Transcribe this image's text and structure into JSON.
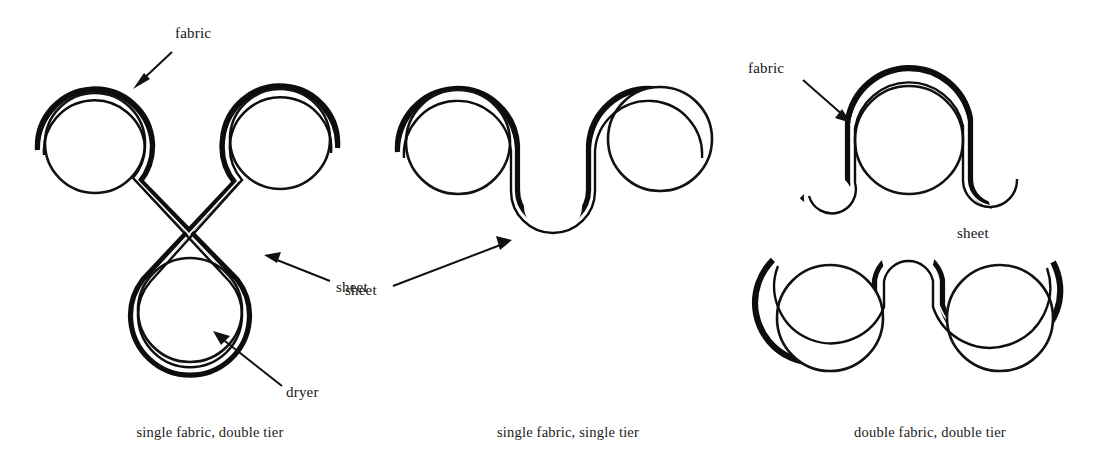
{
  "figure": {
    "background_color": "#ffffff",
    "ink_color": "#0d0d0d",
    "width": 1103,
    "height": 467
  },
  "panels": [
    {
      "id": "single-fabric-double-tier",
      "caption": "single fabric, double tier",
      "caption_x": 210,
      "caption_y": 437,
      "annotations": [
        {
          "name": "fabric",
          "label": "fabric",
          "text_x": 175,
          "text_y": 38,
          "leader_from_x": 172,
          "leader_from_y": 52,
          "leader_to_x": 133,
          "leader_to_y": 89,
          "arrow_angle_deg": 136
        },
        {
          "name": "sheet",
          "label": "sheet",
          "text_x": 336,
          "text_y": 292,
          "leader_from_x": 330,
          "leader_from_y": 281,
          "leader_to_x": 264,
          "leader_to_y": 255,
          "arrow_angle_deg": 201
        },
        {
          "name": "dryer",
          "label": "dryer",
          "text_x": 286,
          "text_y": 397,
          "leader_from_x": 282,
          "leader_from_y": 386,
          "leader_to_x": 213,
          "leader_to_y": 331,
          "arrow_angle_deg": 218
        }
      ],
      "cylinders": [
        {
          "name": "dryer-cylinder-top-left",
          "cx": 95,
          "cy": 143,
          "r": 50
        },
        {
          "name": "dryer-cylinder-top-right",
          "cx": 280,
          "cy": 139,
          "r": 50
        },
        {
          "name": "dryer-cylinder-bottom",
          "cx": 190,
          "cy": 310,
          "r": 52
        }
      ]
    },
    {
      "id": "single-fabric-single-tier",
      "caption": "single fabric, single tier",
      "caption_x": 568,
      "caption_y": 437,
      "annotations": [
        {
          "name": "sheet",
          "label": "sheet",
          "text_x": 345,
          "text_y": 295,
          "leader_from_x": 393,
          "leader_from_y": 286,
          "leader_to_x": 512,
          "leader_to_y": 240,
          "arrow_angle_deg": -21
        }
      ],
      "cylinders": [
        {
          "name": "dryer-cylinder-left",
          "cx": 458,
          "cy": 142,
          "r": 52
        },
        {
          "name": "dryer-cylinder-right",
          "cx": 660,
          "cy": 139,
          "r": 52
        },
        {
          "name": "turning-roll-bottom",
          "cx": 553,
          "cy": 205,
          "r": 28
        }
      ]
    },
    {
      "id": "double-fabric-double-tier",
      "caption": "double fabric, double tier",
      "caption_x": 930,
      "caption_y": 437,
      "annotations": [
        {
          "name": "fabric",
          "label": "fabric",
          "text_x": 748,
          "text_y": 73,
          "leader_from_x": 803,
          "leader_from_y": 80,
          "leader_to_x": 851,
          "leader_to_y": 123,
          "arrow_angle_deg": 42
        },
        {
          "name": "sheet",
          "label": "sheet",
          "text_x": 957,
          "text_y": 238,
          "leader_from_x": null,
          "leader_from_y": null,
          "leader_to_x": null,
          "leader_to_y": null,
          "arrow_angle_deg": null
        }
      ],
      "cylinders": [
        {
          "name": "dryer-cylinder-top",
          "cx": 909,
          "cy": 140,
          "r": 54
        },
        {
          "name": "dryer-cylinder-bottom-left",
          "cx": 830,
          "cy": 318,
          "r": 53
        },
        {
          "name": "dryer-cylinder-bottom-right",
          "cx": 1000,
          "cy": 318,
          "r": 53
        },
        {
          "name": "turning-roll-left",
          "cx": 828,
          "cy": 197,
          "r": 23
        },
        {
          "name": "turning-roll-right",
          "cx": 1012,
          "cy": 195,
          "r": 23
        },
        {
          "name": "turning-roll-center",
          "cx": 908,
          "cy": 257,
          "r": 25
        }
      ]
    }
  ],
  "legend_terms": {
    "fabric": "fabric",
    "sheet": "sheet",
    "dryer": "dryer"
  }
}
